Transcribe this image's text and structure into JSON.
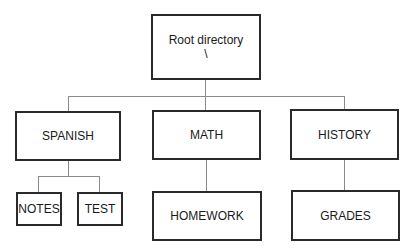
{
  "diagram": {
    "type": "directory-tree",
    "root": {
      "label": "Root directory",
      "sublabel": "\\"
    },
    "children": [
      {
        "label": "SPANISH",
        "children": [
          {
            "label": "NOTES"
          },
          {
            "label": "TEST"
          }
        ]
      },
      {
        "label": "MATH",
        "children": [
          {
            "label": "HOMEWORK"
          }
        ]
      },
      {
        "label": "HISTORY",
        "children": [
          {
            "label": "GRADES"
          }
        ]
      }
    ]
  }
}
